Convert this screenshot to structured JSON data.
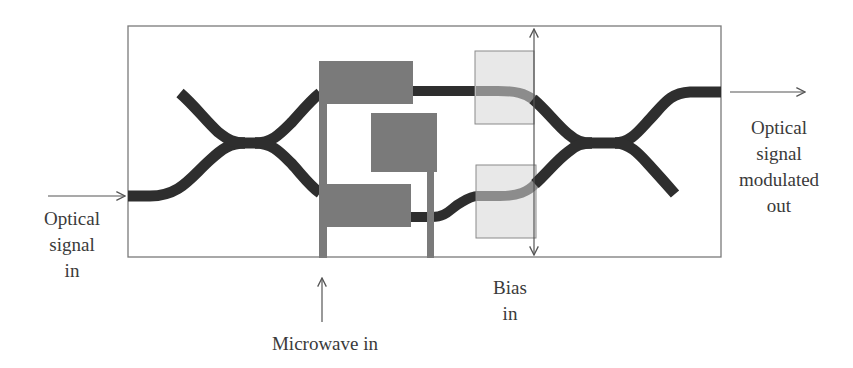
{
  "diagram": {
    "labels": {
      "optical_in": [
        "Optical",
        "signal",
        "in"
      ],
      "optical_out": [
        "Optical",
        "signal",
        "modulated",
        "out"
      ],
      "microwave_in": "Microwave in",
      "bias_in": [
        "Bias",
        "in"
      ]
    },
    "components": {
      "chip_outline": "substrate boundary",
      "input_coupler": "3 dB coupler (input)",
      "output_coupler": "3 dB coupler (output)",
      "rf_electrodes": "microwave travelling-wave electrodes",
      "bias_electrodes": "DC bias electrodes"
    },
    "colors": {
      "waveguide": "#2e2e2e",
      "rf_electrode": "#7a7a7a",
      "bias_electrode_fill": "#e6e6e6",
      "bias_electrode_border": "#8a8a8a",
      "waveguide_under_bias": "#8c8c8c",
      "outline": "#7a7a7a",
      "arrow": "#555555"
    }
  }
}
